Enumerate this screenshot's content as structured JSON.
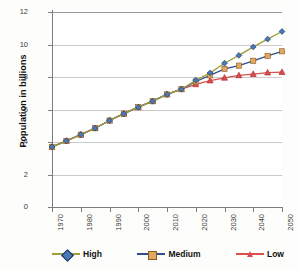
{
  "chart_data": {
    "type": "line",
    "title": "",
    "xlabel": "",
    "ylabel": "Population in billions",
    "xlim": [
      1970,
      2050
    ],
    "ylim": [
      0,
      12
    ],
    "ytick_values": [
      12,
      10,
      8,
      6,
      4,
      2,
      0
    ],
    "ytick_labels": [
      "12",
      "10",
      "8",
      "6",
      "4",
      "2",
      "0"
    ],
    "xtick_values": [
      1970,
      1980,
      1990,
      2000,
      2010,
      2020,
      2030,
      2040,
      2050
    ],
    "xtick_labels": [
      "1970",
      "1980",
      "1990",
      "2000",
      "2010",
      "2020",
      "2030",
      "2040",
      "2050"
    ],
    "grid": "horizontal",
    "legend_position": "bottom",
    "x": [
      1970,
      1975,
      1980,
      1985,
      1990,
      1995,
      2000,
      2005,
      2010,
      2015,
      2020,
      2025,
      2030,
      2035,
      2040,
      2045,
      2050
    ],
    "series": [
      {
        "name": "High",
        "line_color": "#9aa03a",
        "marker_color": "#4a7ab5",
        "marker_edge": "#1b2a5e",
        "marker": "diamond",
        "values": [
          3.7,
          4.07,
          4.45,
          4.85,
          5.32,
          5.74,
          6.14,
          6.51,
          6.93,
          7.25,
          7.8,
          8.25,
          8.85,
          9.33,
          9.85,
          10.33,
          10.8
        ]
      },
      {
        "name": "Medium",
        "line_color": "#2f4f8f",
        "marker_color": "#e0a860",
        "marker_edge": "#8a5a20",
        "marker": "square",
        "values": [
          3.7,
          4.07,
          4.45,
          4.85,
          5.32,
          5.74,
          6.14,
          6.51,
          6.93,
          7.25,
          7.72,
          8.1,
          8.5,
          8.7,
          9.0,
          9.3,
          9.58
        ]
      },
      {
        "name": "Low",
        "line_color": "#d94f4f",
        "marker_color": "#d94f4f",
        "marker_edge": "#a42020",
        "marker": "triangle",
        "values": [
          3.7,
          4.07,
          4.45,
          4.85,
          5.32,
          5.74,
          6.14,
          6.51,
          6.93,
          7.25,
          7.55,
          7.78,
          7.95,
          8.1,
          8.18,
          8.27,
          8.3
        ]
      }
    ]
  },
  "axis": {
    "y_title": "Population in billions"
  },
  "legend": {
    "items": [
      {
        "label": "High"
      },
      {
        "label": "Medium"
      },
      {
        "label": "Low"
      }
    ]
  }
}
